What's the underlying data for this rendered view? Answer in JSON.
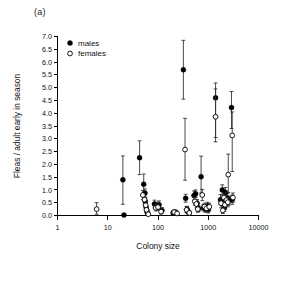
{
  "figure": {
    "panel_label": "(a)",
    "background_color": "#ffffff",
    "foreground_color": "#000000"
  },
  "legend": {
    "position": "top-left-inside",
    "entries": [
      {
        "label": "males",
        "marker": "filled-circle",
        "color": "#000000"
      },
      {
        "label": "females",
        "marker": "open-circle",
        "color": "#000000"
      }
    ]
  },
  "axes": {
    "x": {
      "label": "Colony size",
      "scale": "log10",
      "ticks": [
        "1",
        "10",
        "100",
        "1000",
        "10000"
      ],
      "tick_values": [
        1,
        10,
        100,
        1000,
        10000
      ],
      "range": [
        1,
        10000
      ]
    },
    "y": {
      "label": "Fleas / adult early in season",
      "scale": "linear",
      "ticks": [
        "0.0",
        "0.5",
        "1.0",
        "1.5",
        "2.0",
        "2.5",
        "3.0",
        "3.5",
        "4.0",
        "4.5",
        "5.0",
        "5.5",
        "6.0",
        "6.5",
        "7.0"
      ],
      "tick_values": [
        0.0,
        0.5,
        1.0,
        1.5,
        2.0,
        2.5,
        3.0,
        3.5,
        4.0,
        4.5,
        5.0,
        5.5,
        6.0,
        6.5,
        7.0
      ],
      "range": [
        0.0,
        7.0
      ]
    }
  },
  "chart_data": {
    "type": "scatter",
    "title": "(a)",
    "xlabel": "Colony size",
    "ylabel": "Fleas / adult early in season",
    "xscale": "log",
    "xlim": [
      1,
      10000
    ],
    "ylim": [
      0.0,
      7.0
    ],
    "grid": false,
    "legend_position": "upper left (inside axes)",
    "error_bars": "vertical, with caps (SE/CI)",
    "series": [
      {
        "name": "males",
        "marker": "filled-circle",
        "color": "#000000",
        "points": [
          {
            "x": 20,
            "y": 1.4,
            "lo": 0.44,
            "hi": 2.33
          },
          {
            "x": 21,
            "y": 0.02,
            "lo": 0.0,
            "hi": 0.05
          },
          {
            "x": 43,
            "y": 2.26,
            "lo": 1.6,
            "hi": 2.92
          },
          {
            "x": 52,
            "y": 1.22,
            "lo": 0.82,
            "hi": 1.62
          },
          {
            "x": 55,
            "y": 0.88,
            "lo": 0.72,
            "hi": 1.04
          },
          {
            "x": 56,
            "y": 0.55,
            "lo": 0.4,
            "hi": 0.7
          },
          {
            "x": 58,
            "y": 0.33,
            "lo": 0.21,
            "hi": 0.45
          },
          {
            "x": 60,
            "y": 0.18,
            "lo": 0.08,
            "hi": 0.28
          },
          {
            "x": 62,
            "y": 0.08,
            "lo": 0.02,
            "hi": 0.15
          },
          {
            "x": 85,
            "y": 0.45,
            "lo": 0.3,
            "hi": 0.6
          },
          {
            "x": 95,
            "y": 0.38,
            "lo": 0.25,
            "hi": 0.52
          },
          {
            "x": 105,
            "y": 0.42,
            "lo": 0.28,
            "hi": 0.57
          },
          {
            "x": 120,
            "y": 0.2,
            "lo": 0.1,
            "hi": 0.31
          },
          {
            "x": 200,
            "y": 0.1,
            "lo": 0.03,
            "hi": 0.18
          },
          {
            "x": 225,
            "y": 0.12,
            "lo": 0.04,
            "hi": 0.21
          },
          {
            "x": 320,
            "y": 5.7,
            "lo": 4.55,
            "hi": 6.85
          },
          {
            "x": 355,
            "y": 0.67,
            "lo": 0.52,
            "hi": 0.83
          },
          {
            "x": 380,
            "y": 0.24,
            "lo": 0.12,
            "hi": 0.36
          },
          {
            "x": 400,
            "y": 0.15,
            "lo": 0.06,
            "hi": 0.25
          },
          {
            "x": 520,
            "y": 0.78,
            "lo": 0.6,
            "hi": 0.96
          },
          {
            "x": 560,
            "y": 0.85,
            "lo": 0.7,
            "hi": 1.0
          },
          {
            "x": 600,
            "y": 0.48,
            "lo": 0.34,
            "hi": 0.62
          },
          {
            "x": 640,
            "y": 0.27,
            "lo": 0.15,
            "hi": 0.4
          },
          {
            "x": 720,
            "y": 1.52,
            "lo": 0.88,
            "hi": 2.32
          },
          {
            "x": 800,
            "y": 0.3,
            "lo": 0.18,
            "hi": 0.42
          },
          {
            "x": 880,
            "y": 0.24,
            "lo": 0.13,
            "hi": 0.36
          },
          {
            "x": 960,
            "y": 0.38,
            "lo": 0.24,
            "hi": 0.52
          },
          {
            "x": 1000,
            "y": 0.22,
            "lo": 0.1,
            "hi": 0.34
          },
          {
            "x": 1400,
            "y": 4.6,
            "lo": 3.05,
            "hi": 5.18
          },
          {
            "x": 1750,
            "y": 0.62,
            "lo": 0.42,
            "hi": 0.82
          },
          {
            "x": 1900,
            "y": 1.0,
            "lo": 0.8,
            "hi": 1.2
          },
          {
            "x": 2000,
            "y": 0.55,
            "lo": 0.35,
            "hi": 0.75
          },
          {
            "x": 2100,
            "y": 0.3,
            "lo": 0.16,
            "hi": 0.46
          },
          {
            "x": 2200,
            "y": 0.9,
            "lo": 0.7,
            "hi": 1.1
          },
          {
            "x": 2400,
            "y": 0.68,
            "lo": 0.5,
            "hi": 0.86
          },
          {
            "x": 2600,
            "y": 0.58,
            "lo": 0.4,
            "hi": 0.76
          },
          {
            "x": 2900,
            "y": 4.22,
            "lo": 3.4,
            "hi": 4.85
          },
          {
            "x": 3000,
            "y": 0.62,
            "lo": 0.44,
            "hi": 0.8
          }
        ]
      },
      {
        "name": "females",
        "marker": "open-circle",
        "color": "#000000",
        "points": [
          {
            "x": 6,
            "y": 0.25,
            "lo": 0.05,
            "hi": 0.5
          },
          {
            "x": 50,
            "y": 0.8,
            "lo": 0.62,
            "hi": 0.98
          },
          {
            "x": 54,
            "y": 0.62,
            "lo": 0.46,
            "hi": 0.78
          },
          {
            "x": 57,
            "y": 0.4,
            "lo": 0.26,
            "hi": 0.54
          },
          {
            "x": 59,
            "y": 0.22,
            "lo": 0.1,
            "hi": 0.34
          },
          {
            "x": 64,
            "y": 0.05,
            "lo": 0.0,
            "hi": 0.12
          },
          {
            "x": 90,
            "y": 0.3,
            "lo": 0.18,
            "hi": 0.43
          },
          {
            "x": 100,
            "y": 0.33,
            "lo": 0.2,
            "hi": 0.46
          },
          {
            "x": 115,
            "y": 0.15,
            "lo": 0.06,
            "hi": 0.25
          },
          {
            "x": 210,
            "y": 0.13,
            "lo": 0.04,
            "hi": 0.22
          },
          {
            "x": 240,
            "y": 0.08,
            "lo": 0.01,
            "hi": 0.16
          },
          {
            "x": 345,
            "y": 2.58,
            "lo": 1.38,
            "hi": 3.8
          },
          {
            "x": 370,
            "y": 0.22,
            "lo": 0.1,
            "hi": 0.35
          },
          {
            "x": 420,
            "y": 0.1,
            "lo": 0.02,
            "hi": 0.19
          },
          {
            "x": 540,
            "y": 0.55,
            "lo": 0.4,
            "hi": 0.7
          },
          {
            "x": 580,
            "y": 0.45,
            "lo": 0.3,
            "hi": 0.6
          },
          {
            "x": 620,
            "y": 0.25,
            "lo": 0.13,
            "hi": 0.38
          },
          {
            "x": 760,
            "y": 0.8,
            "lo": 0.58,
            "hi": 1.02
          },
          {
            "x": 840,
            "y": 0.35,
            "lo": 0.22,
            "hi": 0.48
          },
          {
            "x": 920,
            "y": 0.28,
            "lo": 0.15,
            "hi": 0.41
          },
          {
            "x": 1050,
            "y": 0.34,
            "lo": 0.2,
            "hi": 0.48
          },
          {
            "x": 1400,
            "y": 3.86,
            "lo": 2.88,
            "hi": 4.95
          },
          {
            "x": 1800,
            "y": 0.48,
            "lo": 0.3,
            "hi": 0.66
          },
          {
            "x": 1950,
            "y": 0.2,
            "lo": 0.08,
            "hi": 0.34
          },
          {
            "x": 2050,
            "y": 0.7,
            "lo": 0.52,
            "hi": 0.88
          },
          {
            "x": 2150,
            "y": 0.42,
            "lo": 0.26,
            "hi": 0.58
          },
          {
            "x": 2300,
            "y": 0.6,
            "lo": 0.42,
            "hi": 0.78
          },
          {
            "x": 2450,
            "y": 0.52,
            "lo": 0.34,
            "hi": 0.7
          },
          {
            "x": 2500,
            "y": 1.6,
            "lo": 0.9,
            "hi": 2.4
          },
          {
            "x": 3000,
            "y": 3.13,
            "lo": 1.72,
            "hi": 4.05
          },
          {
            "x": 3100,
            "y": 0.7,
            "lo": 0.52,
            "hi": 0.88
          }
        ]
      }
    ]
  }
}
